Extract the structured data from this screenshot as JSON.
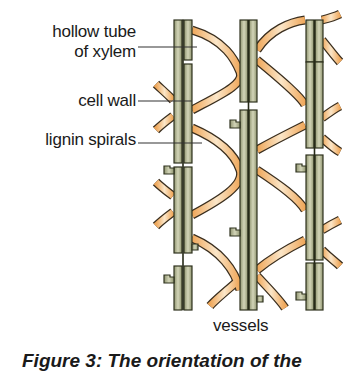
{
  "labels": {
    "hollow_tube": "hollow tube\nof xylem",
    "hollow_tube_line1": "hollow tube",
    "hollow_tube_line2": "of xylem",
    "cell_wall": "cell wall",
    "lignin_spirals": "lignin spirals",
    "vessels": "vessels"
  },
  "caption": "Figure 3: The orientation of the",
  "colors": {
    "wall_fill": "#b9bc97",
    "wall_dark": "#4f5436",
    "lignin": "#f0b36a",
    "lignin_light": "#fbe3c0",
    "outline": "#2a2a22",
    "leader_line": "#333333"
  },
  "diagram": {
    "vessel_count": 3,
    "columns_x": [
      173,
      239,
      305
    ]
  }
}
